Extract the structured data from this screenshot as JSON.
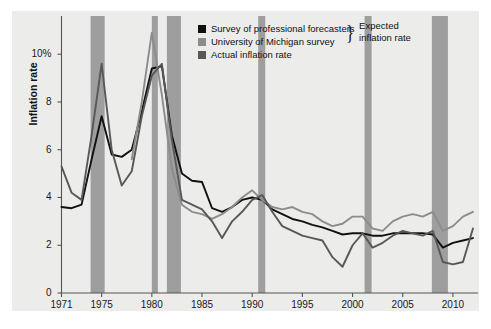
{
  "figure": {
    "background_color": "#ffffff",
    "panel_color": "#ececeb",
    "axis_color": "#555555"
  },
  "axes": {
    "ylabel": "Inflation rate",
    "ytick_labels": [
      "10%",
      "8",
      "6",
      "4",
      "2",
      "0"
    ],
    "ytick_values": [
      10,
      8,
      6,
      4,
      2,
      0
    ],
    "xtick_labels": [
      "1971",
      "1975",
      "1980",
      "1985",
      "1990",
      "1995",
      "2000",
      "2005",
      "2010"
    ],
    "xtick_values": [
      1971,
      1975,
      1980,
      1985,
      1990,
      1995,
      2000,
      2005,
      2010
    ]
  },
  "legend": {
    "items": [
      {
        "label": "Survey of professional forecasters",
        "color": "#111111",
        "swatch_name": "legend-swatch-survey-professional"
      },
      {
        "label": "University of Michigan survey",
        "color": "#8c8c8c",
        "swatch_name": "legend-swatch-michigan"
      },
      {
        "label": "Actual inflation rate",
        "color": "#585858",
        "swatch_name": "legend-swatch-actual"
      }
    ],
    "brace_glyph": "}",
    "brace_label_line1": "Expected",
    "brace_label_line2": "inflation rate"
  },
  "chart_data": {
    "type": "line",
    "title": "",
    "xlabel": "",
    "ylabel": "Inflation rate",
    "xlim": [
      1971,
      2012.5
    ],
    "ylim": [
      0,
      11.6
    ],
    "grid": false,
    "legend_position": "top-center",
    "recession_bands": {
      "color": "#9e9e9e",
      "ranges": [
        [
          1973.9,
          1975.3
        ],
        [
          1980.0,
          1980.6
        ],
        [
          1981.5,
          1982.9
        ],
        [
          1990.6,
          1991.3
        ],
        [
          2001.2,
          2001.9
        ],
        [
          2007.9,
          2009.5
        ]
      ]
    },
    "series": [
      {
        "name": "Survey of professional forecasters",
        "color": "#111111",
        "x": [
          1971,
          1972,
          1973,
          1974,
          1975,
          1976,
          1977,
          1978,
          1979,
          1980,
          1981,
          1982,
          1983,
          1984,
          1985,
          1986,
          1987,
          1988,
          1989,
          1990,
          1991,
          1992,
          1993,
          1994,
          1995,
          1996,
          1997,
          1998,
          1999,
          2000,
          2001,
          2002,
          2003,
          2004,
          2005,
          2006,
          2007,
          2008,
          2009,
          2010,
          2011,
          2012
        ],
        "values": [
          3.6,
          3.55,
          3.7,
          5.6,
          7.4,
          5.8,
          5.7,
          6.0,
          7.6,
          9.4,
          9.5,
          6.6,
          5.0,
          4.7,
          4.65,
          3.55,
          3.4,
          3.6,
          3.9,
          4.0,
          3.9,
          3.5,
          3.3,
          3.1,
          3.0,
          2.85,
          2.75,
          2.6,
          2.45,
          2.5,
          2.5,
          2.4,
          2.4,
          2.5,
          2.5,
          2.5,
          2.5,
          2.45,
          1.9,
          2.1,
          2.2,
          2.3
        ]
      },
      {
        "name": "University of Michigan survey",
        "color": "#8c8c8c",
        "x": [
          1978,
          1979,
          1980,
          1981,
          1982,
          1983,
          1984,
          1985,
          1986,
          1987,
          1988,
          1989,
          1990,
          1991,
          1992,
          1993,
          1994,
          1995,
          1996,
          1997,
          1998,
          1999,
          2000,
          2001,
          2002,
          2003,
          2004,
          2005,
          2006,
          2007,
          2008,
          2009,
          2010,
          2011,
          2012
        ],
        "values": [
          5.6,
          8.0,
          10.9,
          8.3,
          5.2,
          3.7,
          3.4,
          3.3,
          3.1,
          3.3,
          3.6,
          4.0,
          4.3,
          3.9,
          3.6,
          3.5,
          3.6,
          3.4,
          3.3,
          3.0,
          2.8,
          2.9,
          3.2,
          3.2,
          2.7,
          2.6,
          3.0,
          3.2,
          3.3,
          3.2,
          3.4,
          2.6,
          2.8,
          3.2,
          3.4
        ]
      },
      {
        "name": "Actual inflation rate",
        "color": "#585858",
        "x": [
          1971,
          1972,
          1973,
          1974,
          1975,
          1976,
          1977,
          1978,
          1979,
          1980,
          1981,
          1982,
          1983,
          1984,
          1985,
          1986,
          1987,
          1988,
          1989,
          1990,
          1991,
          1992,
          1993,
          1994,
          1995,
          1996,
          1997,
          1998,
          1999,
          2000,
          2001,
          2002,
          2003,
          2004,
          2005,
          2006,
          2007,
          2008,
          2009,
          2010,
          2011,
          2012
        ],
        "values": [
          5.3,
          4.2,
          3.9,
          6.6,
          9.6,
          6.0,
          4.5,
          5.1,
          7.4,
          9.1,
          9.6,
          6.4,
          3.9,
          3.7,
          3.5,
          3.0,
          2.3,
          3.0,
          3.4,
          3.9,
          4.1,
          3.4,
          2.8,
          2.6,
          2.4,
          2.3,
          2.2,
          1.5,
          1.1,
          2.0,
          2.5,
          1.9,
          2.1,
          2.4,
          2.6,
          2.5,
          2.4,
          2.6,
          1.3,
          1.2,
          1.3,
          2.7
        ]
      }
    ]
  }
}
